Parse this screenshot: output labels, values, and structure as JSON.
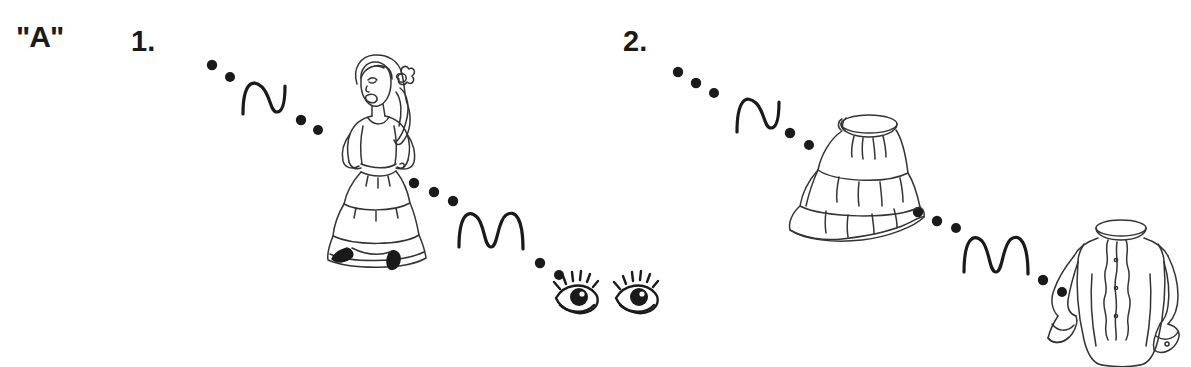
{
  "worksheet": {
    "section_label": "\"A\"",
    "background_color": "#ffffff",
    "ink_color": "#1a1a1a",
    "width": 1191,
    "height": 367
  },
  "items": [
    {
      "number": "1.",
      "start_image": "flamenco-dancer-woman",
      "end_image": "pair-of-eyes",
      "connector": "dotted-trail-with-squiggle"
    },
    {
      "number": "2.",
      "start_image": "tiered-ruffle-skirt",
      "end_image": "ruffled-blouse",
      "connector": "dotted-trail-with-squiggle"
    }
  ],
  "artwork": {
    "dancer": {
      "name": "flamenco-dancer-woman",
      "description": "line drawing of a woman in a tiered flamenco dress with a flower in her hair, hands on hips"
    },
    "eyes": {
      "name": "pair-of-eyes",
      "description": "line drawing of two open eyes with eyelashes"
    },
    "skirt": {
      "name": "tiered-ruffle-skirt",
      "description": "line drawing of a three-tiered ruffled skirt with waistband"
    },
    "blouse": {
      "name": "ruffled-blouse",
      "description": "line drawing of a long sleeved blouse with ruffled front placket, collar and buttoned cuffs"
    }
  },
  "marks": {
    "squiggle_1": "n",
    "squiggle_2": "m",
    "squiggle_3": "n",
    "squiggle_4": "m"
  },
  "trails": {
    "trail_1a": [
      [
        212,
        65
      ],
      [
        229,
        77
      ],
      [
        300,
        120
      ],
      [
        316,
        129
      ]
    ],
    "trail_1b": [
      [
        414,
        183
      ],
      [
        434,
        192
      ],
      [
        452,
        201
      ],
      [
        540,
        264
      ],
      [
        558,
        275
      ]
    ],
    "trail_2a": [
      [
        678,
        72
      ],
      [
        695,
        84
      ],
      [
        712,
        93
      ],
      [
        790,
        133
      ],
      [
        808,
        145
      ]
    ],
    "trail_2b": [
      [
        918,
        212
      ],
      [
        937,
        221
      ],
      [
        956,
        227
      ],
      [
        1043,
        280
      ],
      [
        1061,
        292
      ]
    ]
  }
}
